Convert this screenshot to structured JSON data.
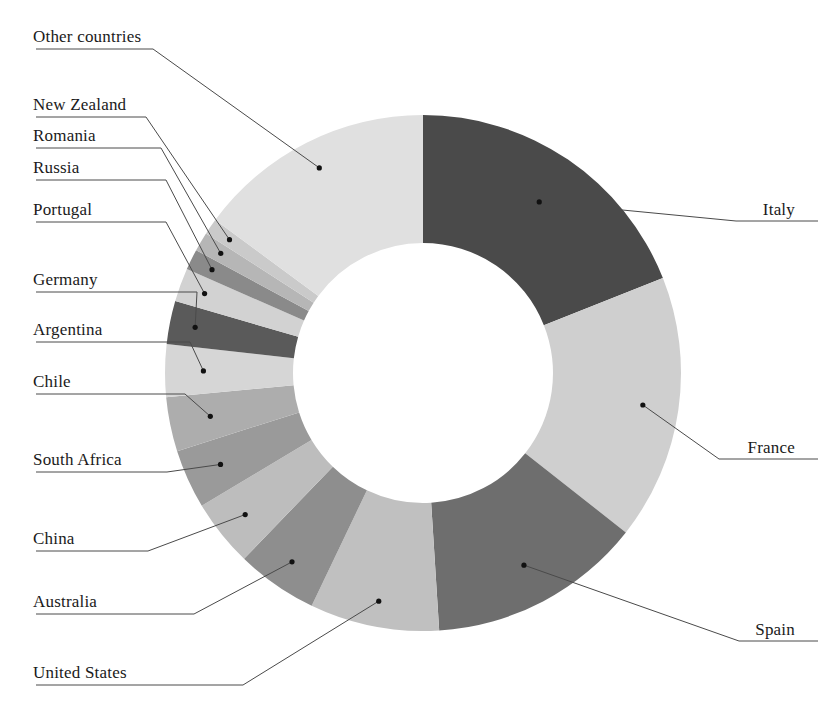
{
  "chart_data": {
    "type": "pie",
    "variant": "donut",
    "title": "",
    "subtitle": "",
    "xlabel": "",
    "ylabel": "",
    "legend_position": "callout-labels",
    "grid": false,
    "start_angle_deg": 0,
    "direction": "clockwise",
    "inner_radius_ratio": 0.505,
    "categories": [
      "Italy",
      "France",
      "Spain",
      "United States",
      "Australia",
      "China",
      "South Africa",
      "Chile",
      "Argentina",
      "Germany",
      "Portugal",
      "Russia",
      "Romania",
      "New Zealand",
      "Other countries"
    ],
    "values": [
      19.0,
      16.6,
      13.4,
      8.1,
      5.1,
      4.2,
      3.7,
      3.4,
      3.3,
      2.7,
      2.1,
      1.3,
      1.2,
      1.0,
      14.9
    ],
    "colors": [
      "#4a4a4a",
      "#cfcfcf",
      "#6e6e6e",
      "#c0c0c0",
      "#8e8e8e",
      "#bdbdbd",
      "#9a9a9a",
      "#adadad",
      "#d6d6d6",
      "#5a5a5a",
      "#d2d2d2",
      "#8a8a8a",
      "#b6b6b6",
      "#cacaca",
      "#e0e0e0"
    ]
  },
  "labels": {
    "italy": "Italy",
    "france": "France",
    "spain": "Spain",
    "united_states": "United States",
    "australia": "Australia",
    "china": "China",
    "south_africa": "South Africa",
    "chile": "Chile",
    "argentina": "Argentina",
    "germany": "Germany",
    "portugal": "Portugal",
    "russia": "Russia",
    "romania": "Romania",
    "new_zealand": "New Zealand",
    "other_countries": "Other countries"
  },
  "geometry": {
    "center_x": 423,
    "center_y": 373,
    "outer_radius": 258,
    "inner_radius": 130
  },
  "style": {
    "background": "#ffffff",
    "text_color": "#1a1a1a",
    "leader_color": "#4a4a4a"
  }
}
